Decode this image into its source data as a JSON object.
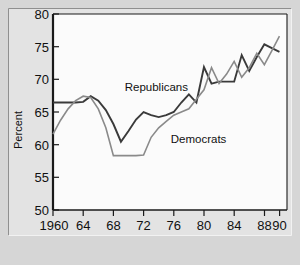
{
  "chart_data": {
    "type": "line",
    "title": "",
    "subtitle": "",
    "xlabel": "",
    "ylabel": "Percent",
    "xlim": [
      1960,
      1991
    ],
    "ylim": [
      50,
      81
    ],
    "grid": false,
    "legend_position": "inline-annotations",
    "y_ticks": [
      50,
      55,
      60,
      65,
      70,
      75,
      80
    ],
    "y_tick_labels": [
      "50",
      "55",
      "60",
      "65",
      "70",
      "75",
      "80"
    ],
    "x_ticks": [
      1960,
      1964,
      1968,
      1972,
      1976,
      1980,
      1984,
      1988,
      1990
    ],
    "x_tick_labels": [
      "1960",
      "64",
      "68",
      "72",
      "76",
      "80",
      "84",
      "88",
      "90"
    ],
    "x": [
      1960,
      1961,
      1962,
      1963,
      1964,
      1965,
      1966,
      1967,
      1968,
      1969,
      1970,
      1971,
      1972,
      1973,
      1974,
      1975,
      1976,
      1977,
      1978,
      1979,
      1980,
      1981,
      1982,
      1983,
      1984,
      1985,
      1986,
      1987,
      1988,
      1989,
      1990
    ],
    "series": [
      {
        "name": "Republicans",
        "color": "#3a3a3a",
        "width": 1.9,
        "values": [
          67.0,
          67.0,
          67.0,
          67.0,
          67.1,
          68.0,
          67.3,
          65.8,
          63.6,
          60.8,
          62.5,
          64.3,
          65.5,
          65.0,
          64.7,
          65.0,
          65.5,
          67.0,
          68.3,
          67.0,
          72.6,
          70.0,
          70.3,
          70.3,
          70.3,
          74.5,
          72.0,
          74.2,
          76.2,
          75.6,
          75.0
        ]
      },
      {
        "name": "Democrats",
        "color": "#8a8a8a",
        "width": 1.6,
        "values": [
          62.0,
          64.2,
          66.0,
          67.3,
          68.0,
          67.8,
          66.0,
          63.0,
          58.6,
          58.6,
          58.6,
          58.6,
          58.7,
          61.5,
          63.0,
          64.0,
          65.0,
          65.5,
          66.0,
          67.5,
          69.0,
          72.5,
          70.0,
          71.5,
          73.5,
          71.0,
          72.5,
          74.8,
          73.0,
          75.2,
          77.5
        ]
      }
    ],
    "annotations": [
      {
        "text": "Republicans",
        "x": 1969.5,
        "y": 68.9,
        "anchor": "start"
      },
      {
        "text": "Democrats",
        "x": 1975.6,
        "y": 60.6,
        "anchor": "start"
      }
    ]
  }
}
